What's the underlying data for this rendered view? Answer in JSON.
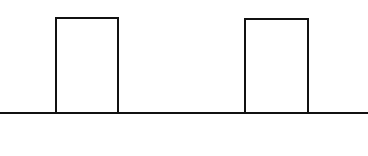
{
  "diagram": {
    "type": "pulse-train",
    "stroke_color": "#111111",
    "background_color": "#ffffff",
    "stroke_width": 2,
    "baseline": {
      "y": 113,
      "x_start": 0,
      "x_end": 368
    },
    "pulses": [
      {
        "x_left": 56,
        "x_right": 118,
        "y_top": 18,
        "y_bottom": 113
      },
      {
        "x_left": 245,
        "x_right": 308,
        "y_top": 19,
        "y_bottom": 113
      }
    ]
  }
}
